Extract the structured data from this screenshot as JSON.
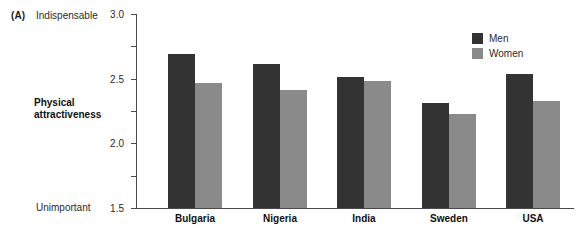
{
  "panel": {
    "label": "(A)"
  },
  "anchors": {
    "top": "Indispensable",
    "bottom": "Unimportant"
  },
  "axis_title": {
    "line1": "Physical",
    "line2": "attractiveness"
  },
  "legend": {
    "men_label": "Men",
    "women_label": "Women",
    "men_color": "#333333",
    "women_color": "#8a8a8a"
  },
  "chart_data": {
    "type": "bar",
    "title": "",
    "xlabel": "",
    "ylabel": "Physical attractiveness",
    "ylim": [
      0,
      3.0
    ],
    "yticks": [
      0,
      0.5,
      1.0,
      1.5,
      2.0,
      2.5,
      3.0
    ],
    "ytick_labels": [
      "0",
      ".5",
      "1.0",
      "1.5",
      "2.0",
      "2.5",
      "3.0"
    ],
    "y_axis_anchor_low": "Unimportant",
    "y_axis_anchor_high": "Indispensable",
    "grid": false,
    "legend_position": "upper right",
    "categories": [
      "Bulgaria",
      "Nigeria",
      "India",
      "Sweden",
      "USA"
    ],
    "series": [
      {
        "name": "Men",
        "color": "#333333",
        "values": [
          2.38,
          2.23,
          2.03,
          1.63,
          2.08
        ]
      },
      {
        "name": "Women",
        "color": "#8a8a8a",
        "values": [
          1.94,
          1.82,
          1.97,
          1.45,
          1.66
        ]
      }
    ]
  }
}
